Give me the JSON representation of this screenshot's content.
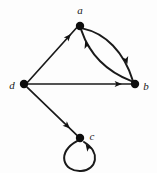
{
  "figure": {
    "type": "directed-graph",
    "background_color": "#fdfdfd",
    "stroke_color": "#1a1a1a",
    "node_color": "#0d0d0d",
    "width": 157,
    "height": 173
  },
  "nodes": [
    {
      "id": "a",
      "label": "a",
      "x": 80,
      "y": 26,
      "radius": 4.2,
      "label_x": 80,
      "label_y": 14,
      "label_anchor": "middle"
    },
    {
      "id": "b",
      "label": "b",
      "x": 135,
      "y": 84,
      "radius": 4.2,
      "label_x": 146,
      "label_y": 90,
      "label_anchor": "middle"
    },
    {
      "id": "c",
      "label": "c",
      "x": 80,
      "y": 138,
      "radius": 4.2,
      "label_x": 92,
      "label_y": 140,
      "label_anchor": "middle"
    },
    {
      "id": "d",
      "label": "d",
      "x": 24,
      "y": 84,
      "radius": 4.2,
      "label_x": 12,
      "label_y": 89,
      "label_anchor": "middle"
    }
  ],
  "edges": [
    {
      "id": "d-a",
      "from": "d",
      "to": "a",
      "shape": "straight",
      "d": "M 27.8 82.0 L 76.6 27.8",
      "arrow": {
        "x": 71.0,
        "y": 34.0,
        "angle": -48
      }
    },
    {
      "id": "d-b",
      "from": "d",
      "to": "b",
      "shape": "straight",
      "d": "M 28.2 84.0 L 131.0 84.0",
      "arrow": {
        "x": 122.0,
        "y": 84.0,
        "angle": 0
      }
    },
    {
      "id": "d-c",
      "from": "d",
      "to": "c",
      "shape": "straight",
      "d": "M 27.0 87.2 L 76.8 135.2",
      "arrow": {
        "x": 70.0,
        "y": 128.6,
        "angle": 44
      }
    },
    {
      "id": "a-b",
      "from": "a",
      "to": "b",
      "shape": "curve-right",
      "d": "M 83.2 28.6 C 105.0 33.0 124.0 52.0 132.8 80.6",
      "arrow": {
        "x": 127.4,
        "y": 64.0,
        "angle": 73
      }
    },
    {
      "id": "b-a",
      "from": "b",
      "to": "a",
      "shape": "curve-left",
      "d": "M 131.6 81.2 C 108.0 72.0 90.0 56.0 81.4 30.4",
      "arrow": {
        "x": 85.2,
        "y": 41.0,
        "angle": -108
      }
    },
    {
      "id": "c-c",
      "from": "c",
      "to": "c",
      "shape": "self-loop",
      "d": "M 77.4 140.8 C 56.0 152.0 63.0 172.0 81.0 171.0 C 97.0 170.0 101.0 152.0 84.0 142.0",
      "arrow": {
        "x": 85.6,
        "y": 144.0,
        "angle": -125
      }
    }
  ]
}
